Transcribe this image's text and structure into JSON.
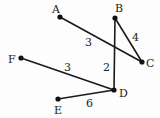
{
  "graph": {
    "nodes": [
      {
        "id": "A",
        "label": "A",
        "x": 60,
        "y": 17,
        "lx": 52,
        "ly": 13
      },
      {
        "id": "B",
        "label": "B",
        "x": 115,
        "y": 18,
        "lx": 115,
        "ly": 12
      },
      {
        "id": "C",
        "label": "C",
        "x": 142,
        "y": 62,
        "lx": 146,
        "ly": 67
      },
      {
        "id": "D",
        "label": "D",
        "x": 114,
        "y": 90,
        "lx": 119,
        "ly": 97
      },
      {
        "id": "E",
        "label": "E",
        "x": 58,
        "y": 99,
        "lx": 54,
        "ly": 114
      },
      {
        "id": "F",
        "label": "F",
        "x": 21,
        "y": 58,
        "lx": 8,
        "ly": 63
      }
    ],
    "edges": [
      {
        "from": "A",
        "to": "C",
        "weight": "3",
        "wx": 85,
        "wy": 46
      },
      {
        "from": "B",
        "to": "C",
        "weight": "4",
        "wx": 132,
        "wy": 41
      },
      {
        "from": "B",
        "to": "D",
        "weight": "2",
        "wx": 103,
        "wy": 71
      },
      {
        "from": "F",
        "to": "D",
        "weight": "3",
        "wx": 64,
        "wy": 71
      },
      {
        "from": "E",
        "to": "D",
        "weight": "6",
        "wx": 86,
        "wy": 107
      }
    ]
  }
}
